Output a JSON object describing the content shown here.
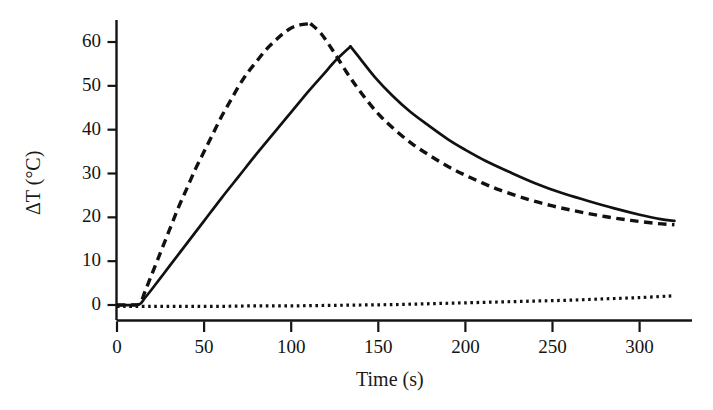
{
  "chart_data": {
    "type": "line",
    "title": "",
    "xlabel": "Time (s)",
    "ylabel": "ΔT (°C)",
    "xlim": [
      0,
      320
    ],
    "ylim": [
      -2,
      66
    ],
    "xticks": [
      0,
      50,
      100,
      150,
      200,
      250,
      300
    ],
    "yticks": [
      0,
      10,
      20,
      30,
      40,
      50,
      60
    ],
    "xtick_labels": [
      "0",
      "50",
      "100",
      "150",
      "200",
      "250",
      "300"
    ],
    "ytick_labels": [
      "0",
      "10",
      "20",
      "30",
      "40",
      "50",
      "60"
    ],
    "grid": false,
    "legend": "none",
    "axis_color": "#141414",
    "series": [
      {
        "name": "dashed-curve",
        "style": "dashed",
        "color": "#111111",
        "peak": {
          "x": 111,
          "y": 64
        },
        "x": [
          0,
          4,
          8,
          13,
          16,
          20,
          25,
          30,
          35,
          40,
          45,
          50,
          55,
          60,
          65,
          70,
          75,
          80,
          85,
          90,
          95,
          100,
          105,
          111,
          117,
          124,
          132,
          140,
          150,
          160,
          170,
          180,
          190,
          200,
          210,
          220,
          235,
          250,
          265,
          280,
          295,
          310,
          320
        ],
        "y": [
          0,
          0,
          0,
          0.3,
          3.0,
          7.0,
          12.0,
          17.0,
          22.0,
          26.5,
          31.0,
          35.0,
          39.0,
          43.0,
          46.5,
          50.0,
          53.0,
          55.5,
          58.0,
          60.0,
          61.8,
          63.2,
          63.9,
          64.2,
          62.0,
          58.0,
          53.0,
          48.5,
          43.6,
          39.8,
          36.6,
          34.0,
          31.6,
          29.6,
          27.8,
          26.2,
          24.2,
          22.6,
          21.3,
          20.2,
          19.3,
          18.6,
          18.3
        ]
      },
      {
        "name": "solid-curve",
        "style": "solid",
        "color": "#111111",
        "peak": {
          "x": 134,
          "y": 59
        },
        "x": [
          0,
          4,
          8,
          13,
          16,
          20,
          25,
          30,
          40,
          50,
          60,
          70,
          80,
          90,
          100,
          110,
          118,
          126,
          134,
          140,
          148,
          158,
          168,
          178,
          190,
          200,
          212,
          225,
          240,
          255,
          270,
          285,
          300,
          312,
          320
        ],
        "y": [
          0,
          0,
          0,
          0.2,
          1.6,
          3.6,
          6.2,
          8.8,
          14.0,
          19.2,
          24.4,
          29.4,
          34.4,
          39.2,
          44.0,
          48.8,
          52.4,
          56.0,
          59.0,
          56.0,
          52.0,
          47.8,
          44.2,
          41.2,
          37.8,
          35.4,
          32.8,
          30.4,
          27.8,
          25.6,
          23.8,
          22.1,
          20.6,
          19.6,
          19.2
        ]
      },
      {
        "name": "dotted-baseline",
        "style": "dotted",
        "color": "#111111",
        "x": [
          0,
          20,
          40,
          60,
          80,
          100,
          120,
          140,
          160,
          180,
          200,
          220,
          240,
          260,
          280,
          300,
          320
        ],
        "y": [
          -0.3,
          -0.3,
          -0.3,
          -0.3,
          -0.2,
          -0.2,
          -0.1,
          0.0,
          0.1,
          0.3,
          0.5,
          0.7,
          0.9,
          1.1,
          1.4,
          1.7,
          2.1
        ]
      }
    ]
  },
  "axes": {
    "ylabel_text": "ΔT (°C)",
    "xlabel_text": "Time (s)"
  }
}
